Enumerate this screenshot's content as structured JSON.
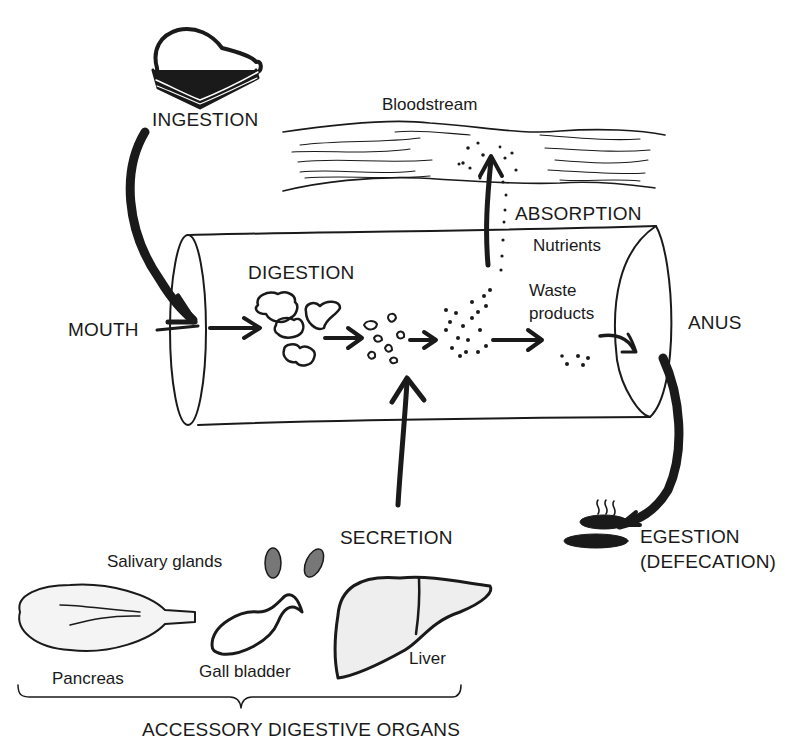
{
  "diagram": {
    "stages": {
      "ingestion": "INGESTION",
      "digestion": "DIGESTION",
      "absorption": "ABSORPTION",
      "secretion": "SECRETION",
      "egestion": "EGESTION",
      "egestion_note": "(DEFECATION)"
    },
    "locations": {
      "mouth": "MOUTH",
      "anus": "ANUS",
      "bloodstream": "Bloodstream"
    },
    "contents": {
      "nutrients": "Nutrients",
      "waste_line1": "Waste",
      "waste_line2": "products"
    },
    "accessory_organs": {
      "group_label": "ACCESSORY DIGESTIVE ORGANS",
      "items": [
        {
          "name": "Salivary glands"
        },
        {
          "name": "Pancreas"
        },
        {
          "name": "Gall bladder"
        },
        {
          "name": "Liver"
        }
      ]
    },
    "icons": [
      "sandwich-icon",
      "feces-icon",
      "salivary-glands-icon",
      "pancreas-icon",
      "gall-bladder-icon",
      "liver-icon"
    ],
    "colors": {
      "ink": "#1a1a1a",
      "background": "#ffffff"
    }
  }
}
